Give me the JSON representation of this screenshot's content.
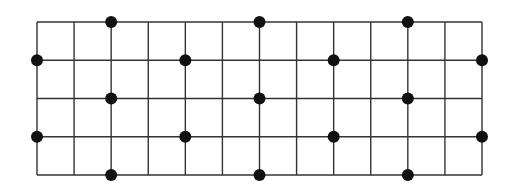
{
  "diagram": {
    "type": "lattice-grid-with-dots",
    "columns": 12,
    "rows": 4,
    "grid": {
      "x0": 37,
      "y0": 22,
      "x1": 482,
      "y1": 175,
      "line_color": "#333333",
      "line_width": 1.4
    },
    "dot": {
      "radius": 6,
      "color": "#111111"
    },
    "dots": [
      {
        "col": 2,
        "row": 0
      },
      {
        "col": 6,
        "row": 0
      },
      {
        "col": 10,
        "row": 0
      },
      {
        "col": 0,
        "row": 1
      },
      {
        "col": 4,
        "row": 1
      },
      {
        "col": 8,
        "row": 1
      },
      {
        "col": 12,
        "row": 1
      },
      {
        "col": 2,
        "row": 2
      },
      {
        "col": 6,
        "row": 2
      },
      {
        "col": 10,
        "row": 2
      },
      {
        "col": 0,
        "row": 3
      },
      {
        "col": 4,
        "row": 3
      },
      {
        "col": 8,
        "row": 3
      },
      {
        "col": 12,
        "row": 3
      },
      {
        "col": 2,
        "row": 4
      },
      {
        "col": 6,
        "row": 4
      },
      {
        "col": 10,
        "row": 4
      }
    ]
  }
}
